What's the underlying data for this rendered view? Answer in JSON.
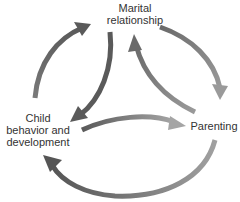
{
  "diagram": {
    "nodes": [
      {
        "id": "marital",
        "line1": "Marital",
        "line2": "relationship"
      },
      {
        "id": "child",
        "line1": "Child",
        "line2": "behavior and",
        "line3": "development"
      },
      {
        "id": "parenting",
        "line1": "Parenting"
      }
    ],
    "edges": [
      {
        "from": "child",
        "to": "marital",
        "style": "outer"
      },
      {
        "from": "marital",
        "to": "parenting",
        "style": "outer"
      },
      {
        "from": "parenting",
        "to": "child",
        "style": "outer"
      },
      {
        "from": "marital",
        "to": "child",
        "style": "inner"
      },
      {
        "from": "parenting",
        "to": "marital",
        "style": "inner"
      },
      {
        "from": "child",
        "to": "parenting",
        "style": "inner"
      }
    ],
    "colors": {
      "arrow_dark": "#5a5a5a",
      "arrow_light": "#8c8c8c",
      "text": "#333333"
    }
  }
}
